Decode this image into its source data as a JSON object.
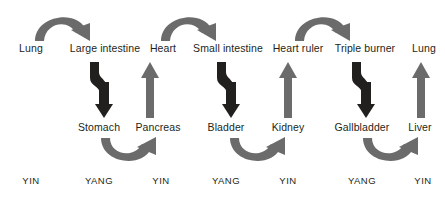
{
  "diagram": {
    "colors": {
      "gray_arrow": "#6b6b6b",
      "black_arrow": "#221f1f",
      "text": "#231f20",
      "background": "#ffffff"
    },
    "rows": {
      "top": {
        "name": "upper-organ-row",
        "labels": [
          {
            "text": "Lung",
            "x": 31
          },
          {
            "text": "Large intestine",
            "x": 105
          },
          {
            "text": "Heart",
            "x": 163
          },
          {
            "text": "Small intestine",
            "x": 228
          },
          {
            "text": "Heart ruler",
            "x": 298
          },
          {
            "text": "Triple burner",
            "x": 365
          },
          {
            "text": "Lung",
            "x": 424
          }
        ]
      },
      "middle": {
        "name": "lower-organ-row",
        "labels": [
          {
            "text": "Stomach",
            "x": 99
          },
          {
            "text": "Pancreas",
            "x": 158
          },
          {
            "text": "Bladder",
            "x": 226
          },
          {
            "text": "Kidney",
            "x": 288
          },
          {
            "text": "Gallbladder",
            "x": 362
          },
          {
            "text": "Liver",
            "x": 420
          }
        ]
      },
      "bottom": {
        "name": "yin-yang-row",
        "labels": [
          {
            "text": "YIN",
            "x": 31
          },
          {
            "text": "YANG",
            "x": 99
          },
          {
            "text": "YIN",
            "x": 161
          },
          {
            "text": "YANG",
            "x": 226
          },
          {
            "text": "YIN",
            "x": 288
          },
          {
            "text": "YANG",
            "x": 362
          },
          {
            "text": "YIN",
            "x": 423
          }
        ]
      }
    },
    "arrows": {
      "top_arcs": {
        "name": "top-curved-arrow",
        "icon": "arc-arrow-right-icon",
        "color": "#6b6b6b",
        "direction": "left-to-right-over",
        "items": [
          {
            "from": "Lung",
            "to": "Large intestine",
            "x": 30,
            "y": 8
          },
          {
            "from": "Heart",
            "to": "Small intestine",
            "x": 156,
            "y": 8
          },
          {
            "from": "Heart ruler",
            "to": "Triple burner",
            "x": 290,
            "y": 8
          }
        ]
      },
      "bottom_arcs": {
        "name": "bottom-curved-arrow",
        "icon": "arc-arrow-up-right-icon",
        "color": "#6b6b6b",
        "direction": "left-to-right-under",
        "items": [
          {
            "from": "Stomach",
            "to": "Pancreas",
            "x": 95,
            "y": 136
          },
          {
            "from": "Bladder",
            "to": "Kidney",
            "x": 224,
            "y": 136
          },
          {
            "from": "Gallbladder",
            "to": "Liver",
            "x": 357,
            "y": 136
          }
        ]
      },
      "descending": {
        "name": "descending-zigzag-arrow",
        "icon": "zigzag-arrow-down-icon",
        "color": "#221f1f",
        "direction": "down",
        "items": [
          {
            "from": "Large intestine",
            "to": "Stomach",
            "x": 78,
            "y": 62
          },
          {
            "from": "Small intestine",
            "to": "Bladder",
            "x": 205,
            "y": 62
          },
          {
            "from": "Triple burner",
            "to": "Gallbladder",
            "x": 340,
            "y": 62
          }
        ]
      },
      "ascending": {
        "name": "ascending-straight-arrow",
        "icon": "arrow-up-icon",
        "color": "#6b6b6b",
        "direction": "up",
        "items": [
          {
            "from": "Pancreas",
            "to": "Heart",
            "x": 140,
            "y": 62
          },
          {
            "from": "Kidney",
            "to": "Heart ruler",
            "x": 278,
            "y": 62
          },
          {
            "from": "Liver",
            "to": "Lung",
            "x": 411,
            "y": 62
          }
        ]
      }
    }
  }
}
